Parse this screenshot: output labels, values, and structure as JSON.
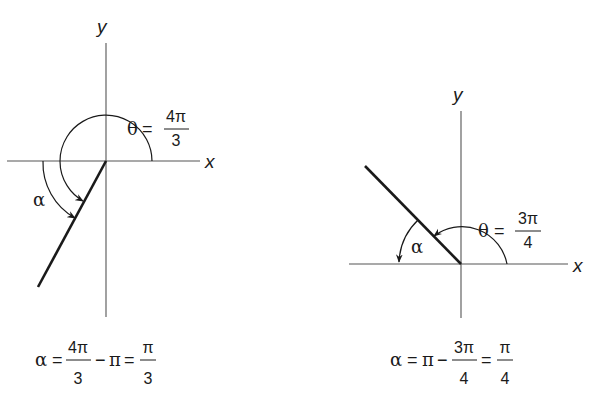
{
  "figures": [
    {
      "id": "left",
      "axis_labels": {
        "x": "x",
        "y": "y"
      },
      "theta_label": {
        "symbol": "θ",
        "eq": "=",
        "numerator": "4π",
        "denominator": "3"
      },
      "alpha_label": "α",
      "theta_value": "4π/3",
      "formula": {
        "lhs": "α",
        "eq1": "=",
        "frac1_num": "4π",
        "frac1_den": "3",
        "op": "−",
        "term": "π",
        "eq2": "=",
        "frac2_num": "π",
        "frac2_den": "3"
      }
    },
    {
      "id": "right",
      "axis_labels": {
        "x": "x",
        "y": "y"
      },
      "theta_label": {
        "symbol": "θ",
        "eq": "=",
        "numerator": "3π",
        "denominator": "4"
      },
      "alpha_label": "α",
      "theta_value": "3π/4",
      "formula": {
        "lhs": "α",
        "eq1": "=",
        "term": "π",
        "op": "−",
        "frac1_num": "3π",
        "frac1_den": "4",
        "eq2": "=",
        "frac2_num": "π",
        "frac2_den": "4"
      }
    }
  ],
  "colors": {
    "line": "#1a1a1a",
    "axis": "#444444",
    "background": "#ffffff"
  }
}
